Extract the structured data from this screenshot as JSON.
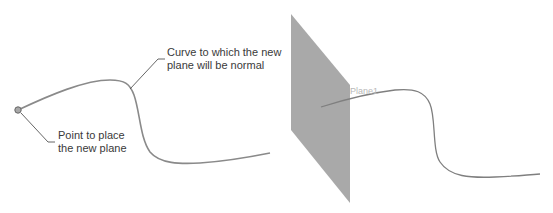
{
  "diagram": {
    "left_panel": {
      "point_callout": {
        "line1": "Point to place",
        "line2": "the new plane"
      },
      "curve_callout": {
        "line1": "Curve to which the new",
        "line2": "plane will be normal"
      }
    },
    "right_panel": {
      "plane_label": "Plane1"
    },
    "colors": {
      "curve": "#808080",
      "plane_fill": "#a8a8a8",
      "point_fill": "#a0a0a0",
      "leader_line": "#555555"
    }
  }
}
